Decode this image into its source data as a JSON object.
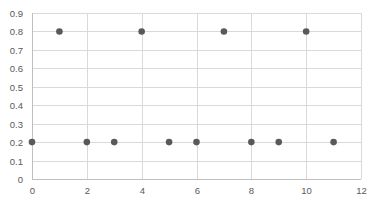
{
  "chart_data": {
    "type": "scatter",
    "title": "",
    "xlabel": "",
    "ylabel": "",
    "xlim": [
      0,
      12
    ],
    "ylim": [
      0,
      0.9
    ],
    "x_ticks": [
      "0",
      "2",
      "4",
      "6",
      "8",
      "10",
      "12"
    ],
    "y_ticks": [
      "0",
      "0.1",
      "0.2",
      "0.3",
      "0.4",
      "0.5",
      "0.6",
      "0.7",
      "0.8",
      "0.9"
    ],
    "grid": true,
    "legend": "none",
    "series": [
      {
        "name": "Series1",
        "x": [
          0,
          1,
          2,
          3,
          4,
          5,
          6,
          7,
          8,
          9,
          10,
          11
        ],
        "y": [
          0.2,
          0.8,
          0.2,
          0.2,
          0.8,
          0.2,
          0.2,
          0.8,
          0.2,
          0.2,
          0.8,
          0.2
        ]
      }
    ]
  },
  "colors": {
    "marker": "#595959",
    "grid": "#d9d9d9",
    "axis": "#bfbfbf",
    "tick_text": "#595959"
  }
}
